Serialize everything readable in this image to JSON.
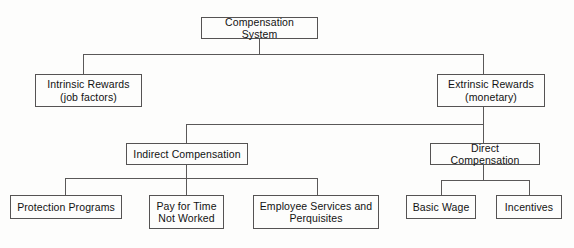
{
  "diagram": {
    "type": "hierarchy-tree",
    "title": "Compensation System",
    "background_color": "#fdfdfc",
    "line_color": "#5a5858",
    "text_color": "#121212",
    "nodes": {
      "root": {
        "label": "Compensation System"
      },
      "intrinsic": {
        "label": "Intrinsic Rewards\n(job factors)"
      },
      "extrinsic": {
        "label": "Extrinsic Rewards\n(monetary)"
      },
      "indirect": {
        "label": "Indirect Compensation"
      },
      "direct": {
        "label": "Direct Compensation"
      },
      "protection": {
        "label": "Protection Programs"
      },
      "paytime": {
        "label": "Pay for Time\nNot Worked"
      },
      "services": {
        "label": "Employee Services and\nPerquisites"
      },
      "basicwage": {
        "label": "Basic Wage"
      },
      "incentives": {
        "label": "Incentives"
      }
    },
    "levels": [
      [
        "Compensation System"
      ],
      [
        "Intrinsic Rewards (job factors)",
        "Extrinsic Rewards (monetary)"
      ],
      [
        "Indirect Compensation",
        "Direct Compensation"
      ],
      [
        "Protection Programs",
        "Pay for Time Not Worked",
        "Employee Services and Perquisites",
        "Basic Wage",
        "Incentives"
      ]
    ],
    "edges": [
      {
        "from": "Compensation System",
        "to": "Intrinsic Rewards (job factors)"
      },
      {
        "from": "Compensation System",
        "to": "Extrinsic Rewards (monetary)"
      },
      {
        "from": "Extrinsic Rewards (monetary)",
        "to": "Indirect Compensation"
      },
      {
        "from": "Extrinsic Rewards (monetary)",
        "to": "Direct Compensation"
      },
      {
        "from": "Indirect Compensation",
        "to": "Protection Programs"
      },
      {
        "from": "Indirect Compensation",
        "to": "Pay for Time Not Worked"
      },
      {
        "from": "Indirect Compensation",
        "to": "Employee Services and Perquisites"
      },
      {
        "from": "Direct Compensation",
        "to": "Basic Wage"
      },
      {
        "from": "Direct Compensation",
        "to": "Incentives"
      }
    ]
  }
}
